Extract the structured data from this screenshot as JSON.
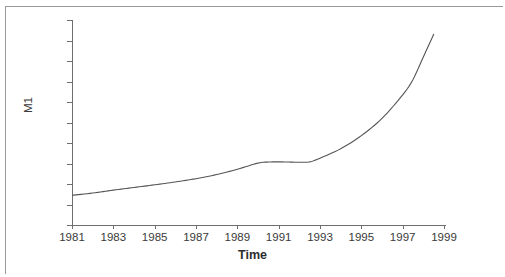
{
  "chart_data": {
    "type": "line",
    "title": "",
    "xlabel": "Time",
    "ylabel": "M1",
    "xlim": [
      1981,
      1999
    ],
    "ylim": [
      0,
      10000
    ],
    "grid": false,
    "legend": null,
    "xticks": [
      1981,
      1983,
      1985,
      1987,
      1989,
      1991,
      1993,
      1995,
      1997,
      1999
    ],
    "xtick_labels": [
      "1981",
      "1983",
      "1985",
      "1987",
      "1989",
      "1991",
      "1993",
      "1995",
      "1997",
      "1999"
    ],
    "yticks": [
      0,
      1000,
      2000,
      3000,
      4000,
      5000,
      6000,
      7000,
      8000,
      9000,
      10000
    ],
    "ytick_labels": [
      "0",
      "1000",
      "2000",
      "3000",
      "4000",
      "5000",
      "6000",
      "7000",
      "8000",
      "9000",
      "10000"
    ],
    "line_color": "#555555",
    "series": [
      {
        "name": "M1",
        "x": [
          1981.0,
          1982.0,
          1983.0,
          1984.0,
          1985.0,
          1986.0,
          1987.0,
          1988.0,
          1989.0,
          1990.0,
          1990.5,
          1991.0,
          1991.5,
          1992.0,
          1992.5,
          1993.0,
          1994.0,
          1995.0,
          1996.0,
          1997.0,
          1997.5,
          1998.0,
          1998.5
        ],
        "values": [
          1450,
          1560,
          1700,
          1830,
          1960,
          2100,
          2260,
          2460,
          2720,
          3020,
          3070,
          3080,
          3070,
          3060,
          3080,
          3260,
          3720,
          4360,
          5200,
          6350,
          7100,
          8200,
          9300
        ]
      }
    ],
    "annotations": []
  },
  "figure": {
    "border_color": "#9a9a9a",
    "axis_color": "#6e6e6e",
    "background": "#ffffff"
  }
}
